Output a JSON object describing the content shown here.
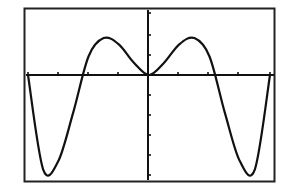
{
  "title": "Graphing calculator plot",
  "colors": {
    "background": "#ffffff",
    "ink": "#111111",
    "border": "#222222"
  },
  "chart_data": {
    "type": "line",
    "title": "",
    "xlabel": "",
    "ylabel": "",
    "grid": false,
    "legend": null,
    "window": {
      "x_ticks": 8,
      "y_ticks_above": 3,
      "y_ticks_below": 5
    },
    "x_tick_pixels": [
      28,
      58,
      88,
      118,
      148,
      178,
      208,
      238,
      270
    ],
    "y_tick_pixels": [
      13,
      35,
      55,
      95,
      115,
      135,
      155,
      175
    ],
    "axis_pixels": {
      "x_axis_y": 75,
      "y_axis_x": 148
    },
    "plot_box": {
      "left": 24,
      "top": 8,
      "right": 275,
      "bottom": 182
    },
    "series": [
      {
        "name": "y",
        "x": [
          -4,
          -3.5,
          -3,
          -2.5,
          -2,
          -1.5,
          -1,
          -0.5,
          0,
          0.5,
          1,
          1.5,
          2,
          2.5,
          3,
          3.5,
          4
        ],
        "values": [
          0,
          -4.6,
          -4.2,
          -1.8,
          0.9,
          1.8,
          1.5,
          0.6,
          0,
          0.6,
          1.5,
          1.8,
          0.9,
          -1.8,
          -4.2,
          -4.6,
          0
        ]
      }
    ],
    "annotations": []
  }
}
